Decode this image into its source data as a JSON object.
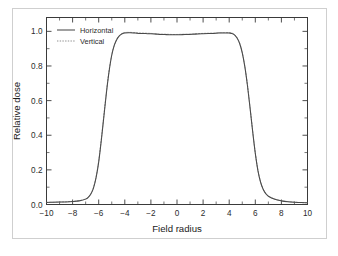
{
  "figure": {
    "border_color": "#cfcfcf",
    "background": "#ffffff"
  },
  "chart_data": {
    "type": "line",
    "title": "",
    "subtitle": "",
    "xlabel": "Field radius",
    "ylabel": "Relative dose",
    "xlim": [
      -10,
      10
    ],
    "ylim": [
      0.0,
      1.08
    ],
    "grid": false,
    "legend_position": "top-left inside axes",
    "x_major_ticks": [
      -10,
      -8,
      -6,
      -4,
      -2,
      0,
      2,
      4,
      6,
      8,
      10
    ],
    "x_tick_labels": [
      "-10",
      "-8",
      "-6",
      "-4",
      "-2",
      "0",
      "2",
      "4",
      "6",
      "8",
      "10"
    ],
    "x_minor_ticks": [
      -9,
      -7,
      -5,
      -3,
      -1,
      1,
      3,
      5,
      7,
      9
    ],
    "y_major_ticks": [
      0.0,
      0.2,
      0.4,
      0.6,
      0.8,
      1.0
    ],
    "y_tick_labels": [
      "0.0",
      "0.2",
      "0.4",
      "0.6",
      "0.8",
      "1.0"
    ],
    "y_minor_ticks": [
      0.1,
      0.3,
      0.5,
      0.7,
      0.9
    ],
    "axis_color": "#3a3a3a",
    "x": [
      -10.0,
      -9.5,
      -9.0,
      -8.5,
      -8.0,
      -7.5,
      -7.0,
      -6.8,
      -6.6,
      -6.4,
      -6.2,
      -6.0,
      -5.8,
      -5.6,
      -5.4,
      -5.2,
      -5.0,
      -4.8,
      -4.6,
      -4.4,
      -4.2,
      -4.0,
      -3.6,
      -3.2,
      -2.8,
      -2.4,
      -2.0,
      -1.6,
      -1.2,
      -0.8,
      -0.4,
      0.0,
      0.4,
      0.8,
      1.2,
      1.6,
      2.0,
      2.4,
      2.8,
      3.2,
      3.6,
      4.0,
      4.2,
      4.4,
      4.6,
      4.8,
      5.0,
      5.2,
      5.4,
      5.6,
      5.8,
      6.0,
      6.2,
      6.4,
      6.6,
      6.8,
      7.0,
      7.5,
      8.0,
      8.5,
      9.0,
      9.5,
      10.0
    ],
    "series": [
      {
        "name": "Horizontal",
        "style": "solid",
        "color": "#4a4a4a",
        "values": [
          0.012,
          0.013,
          0.014,
          0.015,
          0.017,
          0.021,
          0.031,
          0.041,
          0.06,
          0.095,
          0.155,
          0.245,
          0.37,
          0.51,
          0.65,
          0.77,
          0.862,
          0.92,
          0.955,
          0.975,
          0.986,
          0.991,
          0.992,
          0.99,
          0.988,
          0.987,
          0.986,
          0.984,
          0.982,
          0.981,
          0.98,
          0.98,
          0.981,
          0.982,
          0.983,
          0.985,
          0.986,
          0.987,
          0.988,
          0.99,
          0.991,
          0.99,
          0.988,
          0.98,
          0.962,
          0.93,
          0.876,
          0.795,
          0.686,
          0.556,
          0.42,
          0.295,
          0.196,
          0.13,
          0.088,
          0.063,
          0.048,
          0.03,
          0.021,
          0.016,
          0.013,
          0.011,
          0.01
        ]
      },
      {
        "name": "Vertical",
        "style": "dotted",
        "color": "#8a8a8a",
        "values": [
          0.012,
          0.013,
          0.014,
          0.016,
          0.018,
          0.022,
          0.032,
          0.043,
          0.063,
          0.099,
          0.16,
          0.252,
          0.378,
          0.518,
          0.657,
          0.776,
          0.866,
          0.923,
          0.957,
          0.977,
          0.988,
          0.993,
          0.994,
          0.992,
          0.99,
          0.989,
          0.988,
          0.986,
          0.984,
          0.983,
          0.982,
          0.982,
          0.983,
          0.984,
          0.985,
          0.987,
          0.988,
          0.989,
          0.99,
          0.992,
          0.993,
          0.992,
          0.99,
          0.982,
          0.964,
          0.932,
          0.879,
          0.798,
          0.69,
          0.56,
          0.424,
          0.298,
          0.199,
          0.132,
          0.09,
          0.064,
          0.049,
          0.031,
          0.022,
          0.017,
          0.014,
          0.011,
          0.01
        ]
      }
    ],
    "legend": [
      {
        "label": "Horizontal",
        "style": "solid"
      },
      {
        "label": "Vertical",
        "style": "dotted"
      }
    ]
  }
}
